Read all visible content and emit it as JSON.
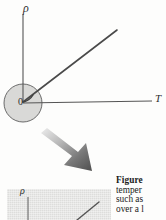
{
  "figure": {
    "kind": "resistivity-vs-temperature-diagram",
    "main_plot": {
      "y_axis_label": "ρ",
      "x_axis_label": "T",
      "origin_label": "0",
      "curve_description": "straight line rising from origin",
      "highlight_circle": "shaded circle around origin"
    },
    "inset_plot": {
      "y_axis_label": "ρ",
      "background_color": "#e3e3e1",
      "curve_description": "straight line rising to the right"
    },
    "callout_arrow": {
      "name": "magnify-arrow",
      "direction": "down-right"
    },
    "colors": {
      "ink": "#3a3a3a",
      "circle_fill": "#d9d9d7",
      "inset_fill": "#e3e3e1",
      "arrow_dark": "#5a5a5a",
      "arrow_light": "#d7d7d7"
    }
  },
  "caption": {
    "lead": "Figure",
    "lines": [
      "Figure",
      "temper",
      "such as",
      "over a l"
    ]
  }
}
